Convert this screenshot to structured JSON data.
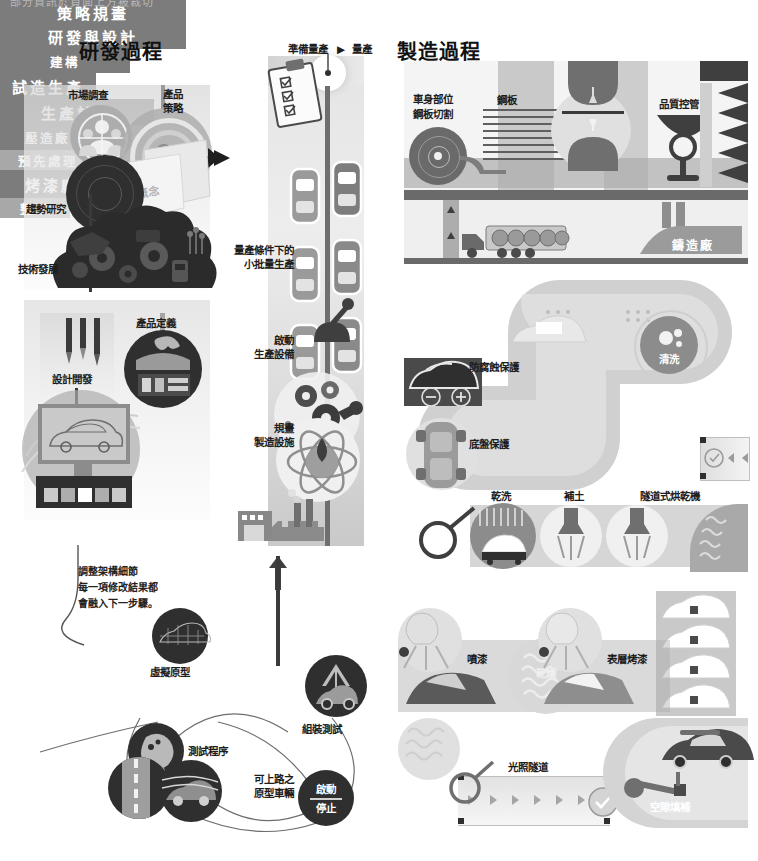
{
  "page": {
    "cut_off_top_line": "部分資訊於頁面上方被裁切"
  },
  "columns": {
    "development": {
      "title": "研發過程",
      "bars": [
        {
          "id": "strategy",
          "label": "策略規畫"
        },
        {
          "id": "rnd_design",
          "label": "研發與設計"
        },
        {
          "id": "architecture",
          "label": "建構"
        }
      ],
      "labels": [
        {
          "id": "market-research",
          "text": "市場調查"
        },
        {
          "id": "product-strategy",
          "text": "產品\n策略"
        },
        {
          "id": "trend-research",
          "text": "趨勢研究"
        },
        {
          "id": "tech-development",
          "text": "技術發展"
        },
        {
          "id": "product-definition",
          "text": "產品定義"
        },
        {
          "id": "design-development",
          "text": "設計開發"
        },
        {
          "id": "concept-note",
          "text": "概念"
        }
      ],
      "annotation": {
        "line1": "調整架構細節",
        "line2": "每一項修改結果都",
        "line3": "會融入下一步驟。"
      }
    },
    "pilot": {
      "header": {
        "from": "準備量產",
        "arrow": "▶",
        "to": "量產"
      },
      "bars": [
        {
          "id": "trial-production",
          "label": "試造生產"
        },
        {
          "id": "production-plan",
          "label": "生產計畫"
        }
      ],
      "labels": [
        {
          "id": "small-batch",
          "text": "量產條件下的\n小批量生產"
        },
        {
          "id": "start-equipment",
          "text": "啟動\n生產設備"
        },
        {
          "id": "plan-facility",
          "text": "規畫\n製造設施"
        }
      ]
    },
    "testing": {
      "nodes": [
        {
          "id": "virtual-prototype",
          "label": "虛擬原型"
        },
        {
          "id": "test-procedure",
          "label": "測試程序"
        },
        {
          "id": "assembly-test",
          "label": "組裝測試"
        },
        {
          "id": "road-legal-prototype",
          "label": "可上路之\n原型車輛"
        }
      ],
      "toggle": {
        "on": "啟動",
        "off": "停止"
      }
    },
    "manufacturing": {
      "title": "製造過程",
      "bars": [
        {
          "id": "press-shop",
          "label": "壓造廠"
        },
        {
          "id": "foundry",
          "label": "鑄造廠"
        },
        {
          "id": "paint-shop",
          "label": "烤漆廠"
        }
      ],
      "labels": [
        {
          "id": "body-panel-cut",
          "text": "車身部位\n鋼板切割"
        },
        {
          "id": "steel-sheet",
          "text": "鋼板"
        },
        {
          "id": "pressing",
          "text": "壓造"
        },
        {
          "id": "quality-control",
          "text": "品質控管"
        },
        {
          "id": "pretreatment",
          "text": "預先處理"
        },
        {
          "id": "anticorrosion",
          "text": "防腐蝕保護"
        },
        {
          "id": "underbody-protection",
          "text": "底盤保護"
        },
        {
          "id": "washing",
          "text": "清洗"
        },
        {
          "id": "dry-wash",
          "text": "乾洗"
        },
        {
          "id": "filler",
          "text": "補土"
        },
        {
          "id": "tunnel-dryer",
          "text": "隧道式烘乾機"
        },
        {
          "id": "leveling",
          "text": "整平"
        },
        {
          "id": "spray-paint",
          "text": "噴漆"
        },
        {
          "id": "topcoat-bake",
          "text": "表層烤漆"
        },
        {
          "id": "drying",
          "text": "乾燥"
        },
        {
          "id": "light-tunnel",
          "text": "光照隧道"
        },
        {
          "id": "gap-filling",
          "text": "空隙填補"
        }
      ]
    }
  },
  "colors": {
    "bar": "#7c7c7c",
    "bar_light": "#a8a8a8",
    "text": "#1a1a1a",
    "dark": "#2f2f2f",
    "mid": "#8c8c8c",
    "light": "#e0e0e0"
  }
}
